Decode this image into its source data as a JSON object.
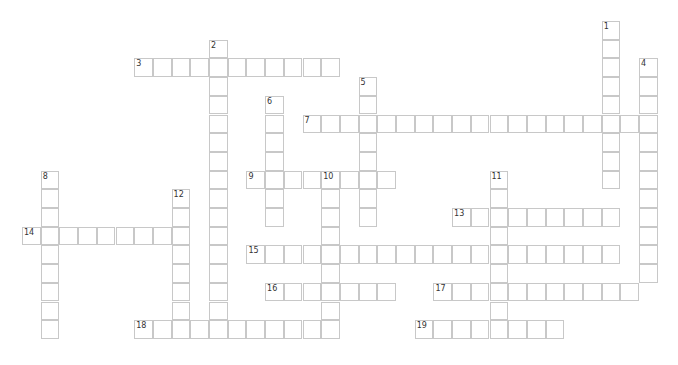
{
  "puzzle": {
    "type": "crossword",
    "cell_pitch": 18.7,
    "origin": {
      "x": 22,
      "y": 21
    },
    "colors": {
      "border": "#c8c8c8",
      "background": "#ffffff",
      "number": "#333333"
    },
    "entries": [
      {
        "number": "1",
        "direction": "down",
        "row": 0,
        "col": 31,
        "length": 9
      },
      {
        "number": "2",
        "direction": "down",
        "row": 1,
        "col": 10,
        "length": 16
      },
      {
        "number": "3",
        "direction": "across",
        "row": 2,
        "col": 6,
        "length": 11
      },
      {
        "number": "4",
        "direction": "down",
        "row": 2,
        "col": 33,
        "length": 12
      },
      {
        "number": "5",
        "direction": "down",
        "row": 3,
        "col": 18,
        "length": 8
      },
      {
        "number": "6",
        "direction": "down",
        "row": 4,
        "col": 13,
        "length": 7
      },
      {
        "number": "7",
        "direction": "across",
        "row": 5,
        "col": 15,
        "length": 19
      },
      {
        "number": "8",
        "direction": "down",
        "row": 8,
        "col": 1,
        "length": 9
      },
      {
        "number": "9",
        "direction": "across",
        "row": 8,
        "col": 12,
        "length": 8
      },
      {
        "number": "10",
        "direction": "down",
        "row": 8,
        "col": 16,
        "length": 9
      },
      {
        "number": "11",
        "direction": "down",
        "row": 8,
        "col": 25,
        "length": 9
      },
      {
        "number": "12",
        "direction": "down",
        "row": 9,
        "col": 8,
        "length": 8
      },
      {
        "number": "13",
        "direction": "across",
        "row": 10,
        "col": 23,
        "length": 9
      },
      {
        "number": "14",
        "direction": "across",
        "row": 11,
        "col": 0,
        "length": 9
      },
      {
        "number": "15",
        "direction": "across",
        "row": 12,
        "col": 12,
        "length": 20
      },
      {
        "number": "16",
        "direction": "across",
        "row": 14,
        "col": 13,
        "length": 7
      },
      {
        "number": "17",
        "direction": "across",
        "row": 14,
        "col": 22,
        "length": 11
      },
      {
        "number": "18",
        "direction": "across",
        "row": 16,
        "col": 6,
        "length": 11
      },
      {
        "number": "19",
        "direction": "across",
        "row": 16,
        "col": 21,
        "length": 8
      }
    ]
  }
}
